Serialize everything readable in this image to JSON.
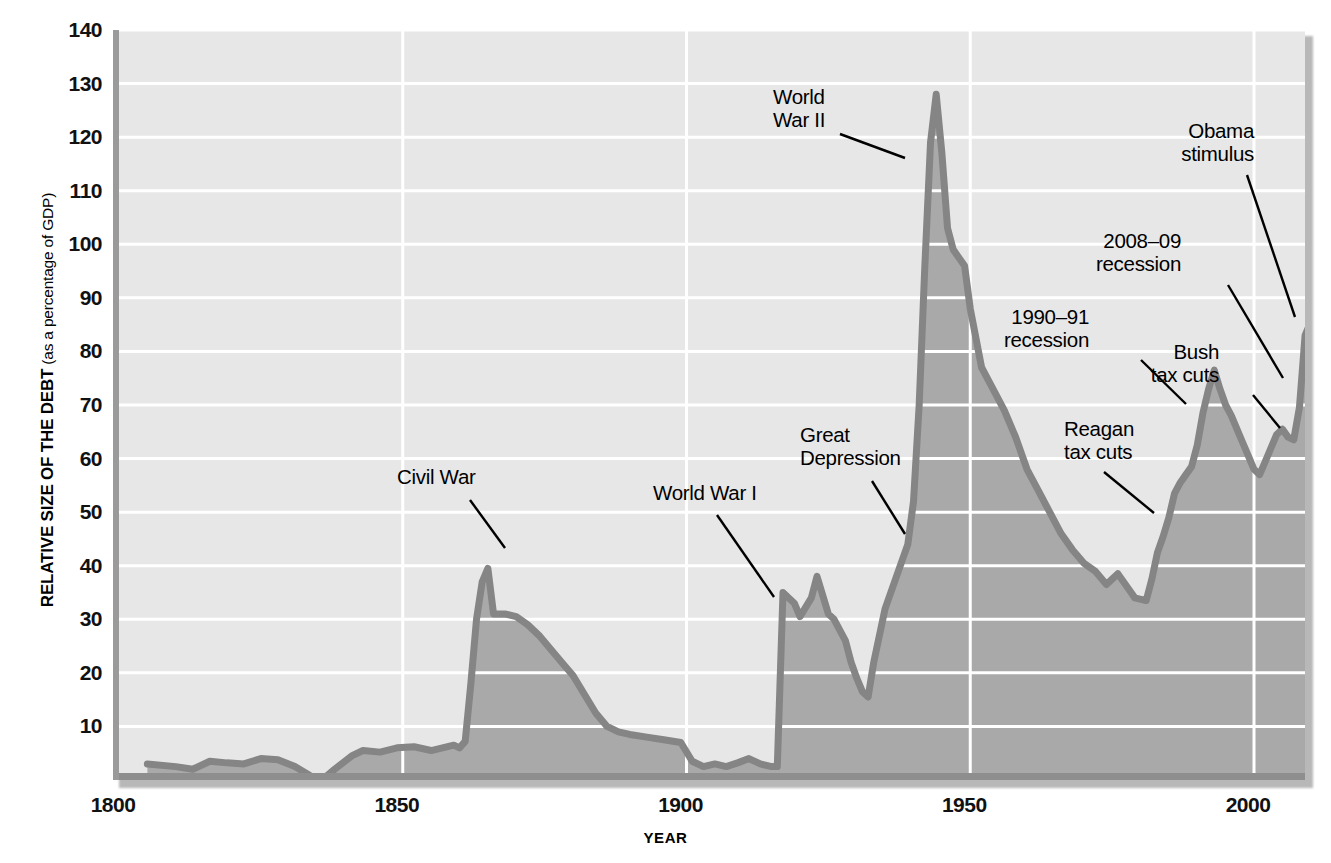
{
  "axes": {
    "y_title_main": "RELATIVE SIZE OF THE DEBT",
    "y_title_sub": " (as a percentage of GDP)",
    "x_title": "YEAR",
    "y_ticks": [
      "10",
      "20",
      "30",
      "40",
      "50",
      "60",
      "70",
      "80",
      "90",
      "100",
      "110",
      "120",
      "130",
      "140"
    ],
    "x_ticks": [
      "1800",
      "1850",
      "1900",
      "1950",
      "2000"
    ]
  },
  "colors": {
    "plot_background": "#e7e7e7",
    "area_fill": "#a9a9a9",
    "line": "#858585",
    "gridline": "#ffffff",
    "axis_spine": "#9a9a9a",
    "text": "#000000"
  },
  "annotations": [
    {
      "id": "civil-war",
      "label": "Civil War",
      "lines": [
        "Civil War"
      ],
      "align": "left",
      "x": 397,
      "y": 465,
      "leader": [
        [
          470,
          500
        ],
        [
          505,
          548
        ]
      ]
    },
    {
      "id": "world-war-1",
      "label": "World War I",
      "lines": [
        "World War I"
      ],
      "align": "left",
      "x": 653,
      "y": 481,
      "leader": [
        [
          717,
          515
        ],
        [
          774,
          597
        ]
      ]
    },
    {
      "id": "great-depression",
      "label": "Great Depression",
      "lines": [
        "Great",
        "Depression"
      ],
      "align": "left",
      "x": 800,
      "y": 423,
      "leader": [
        [
          872,
          481
        ],
        [
          905,
          534
        ]
      ]
    },
    {
      "id": "world-war-2",
      "label": "World War II",
      "lines": [
        "World",
        "War II"
      ],
      "align": "left",
      "x": 773,
      "y": 85,
      "leader": [
        [
          840,
          134
        ],
        [
          905,
          158
        ]
      ]
    },
    {
      "id": "reagan-tax-cuts",
      "label": "Reagan tax cuts",
      "lines": [
        "Reagan",
        "tax cuts"
      ],
      "align": "left",
      "x": 1064,
      "y": 417,
      "leader": [
        [
          1104,
          472
        ],
        [
          1154,
          513
        ]
      ]
    },
    {
      "id": "recession-1990",
      "label": "1990–91 recession",
      "lines": [
        "1990–91",
        "recession"
      ],
      "align": "right",
      "x": 1089,
      "y": 305,
      "leader": [
        [
          1141,
          360
        ],
        [
          1186,
          404
        ]
      ]
    },
    {
      "id": "recession-2008",
      "label": "2008–09 recession",
      "lines": [
        "2008–09",
        "recession"
      ],
      "align": "right",
      "x": 1181,
      "y": 229,
      "leader": [
        [
          1228,
          285
        ],
        [
          1283,
          378
        ]
      ]
    },
    {
      "id": "bush-tax-cuts",
      "label": "Bush tax cuts",
      "lines": [
        "Bush",
        "tax cuts"
      ],
      "align": "right",
      "x": 1219,
      "y": 340,
      "leader": [
        [
          1253,
          395
        ],
        [
          1280,
          428
        ]
      ]
    },
    {
      "id": "obama-stimulus",
      "label": "Obama stimulus",
      "lines": [
        "Obama",
        "stimulus"
      ],
      "align": "right",
      "x": 1254,
      "y": 119,
      "leader": [
        [
          1247,
          175
        ],
        [
          1295,
          317
        ]
      ]
    }
  ],
  "chart_data": {
    "type": "area",
    "title": "",
    "xlabel": "YEAR",
    "ylabel": "RELATIVE SIZE OF THE DEBT (as a percentage of GDP)",
    "xlim": [
      1800,
      2012
    ],
    "ylim": [
      0,
      140
    ],
    "grid": true,
    "legend": false,
    "x_tick_values": [
      1800,
      1850,
      1900,
      1950,
      2000
    ],
    "y_tick_values": [
      10,
      20,
      30,
      40,
      50,
      60,
      70,
      80,
      90,
      100,
      110,
      120,
      130,
      140
    ],
    "series": [
      {
        "name": "U.S. federal debt as percent of GDP",
        "points": [
          [
            1805,
            3.0
          ],
          [
            1810,
            2.5
          ],
          [
            1813,
            2.0
          ],
          [
            1816,
            3.5
          ],
          [
            1819,
            3.2
          ],
          [
            1822,
            3.0
          ],
          [
            1825,
            4.0
          ],
          [
            1828,
            3.8
          ],
          [
            1831,
            2.5
          ],
          [
            1834,
            0.6
          ],
          [
            1836,
            0.2
          ],
          [
            1838,
            2.0
          ],
          [
            1841,
            4.5
          ],
          [
            1843,
            5.5
          ],
          [
            1846,
            5.2
          ],
          [
            1849,
            6.0
          ],
          [
            1852,
            6.2
          ],
          [
            1855,
            5.5
          ],
          [
            1857,
            6.0
          ],
          [
            1859,
            6.5
          ],
          [
            1860,
            6.0
          ],
          [
            1861,
            7.2
          ],
          [
            1862,
            18.0
          ],
          [
            1863,
            30.0
          ],
          [
            1864,
            37.0
          ],
          [
            1865,
            39.5
          ],
          [
            1866,
            31.0
          ],
          [
            1868,
            31.0
          ],
          [
            1870,
            30.5
          ],
          [
            1872,
            29.0
          ],
          [
            1874,
            27.0
          ],
          [
            1876,
            24.5
          ],
          [
            1878,
            22.0
          ],
          [
            1880,
            19.5
          ],
          [
            1882,
            16.0
          ],
          [
            1884,
            12.5
          ],
          [
            1886,
            10.0
          ],
          [
            1888,
            9.0
          ],
          [
            1890,
            8.5
          ],
          [
            1893,
            8.0
          ],
          [
            1896,
            7.5
          ],
          [
            1899,
            7.0
          ],
          [
            1901,
            3.5
          ],
          [
            1903,
            2.5
          ],
          [
            1905,
            3.0
          ],
          [
            1907,
            2.5
          ],
          [
            1909,
            3.2
          ],
          [
            1911,
            4.0
          ],
          [
            1913,
            3.0
          ],
          [
            1915,
            2.5
          ],
          [
            1916,
            2.5
          ],
          [
            1917,
            35.0
          ],
          [
            1919,
            33.0
          ],
          [
            1920,
            30.5
          ],
          [
            1922,
            34.0
          ],
          [
            1923,
            38.0
          ],
          [
            1925,
            31.0
          ],
          [
            1926,
            30.0
          ],
          [
            1928,
            26.0
          ],
          [
            1929,
            22.0
          ],
          [
            1930,
            19.0
          ],
          [
            1931,
            16.5
          ],
          [
            1932,
            15.5
          ],
          [
            1933,
            22.0
          ],
          [
            1935,
            32.0
          ],
          [
            1937,
            38.0
          ],
          [
            1939,
            44.0
          ],
          [
            1940,
            52.0
          ],
          [
            1941,
            70.0
          ],
          [
            1942,
            96.0
          ],
          [
            1943,
            119.0
          ],
          [
            1944,
            128.0
          ],
          [
            1945,
            117.0
          ],
          [
            1946,
            103.0
          ],
          [
            1947,
            99.0
          ],
          [
            1948,
            97.5
          ],
          [
            1949,
            96.0
          ],
          [
            1950,
            88.0
          ],
          [
            1952,
            77.0
          ],
          [
            1954,
            73.0
          ],
          [
            1956,
            69.0
          ],
          [
            1958,
            64.0
          ],
          [
            1960,
            58.0
          ],
          [
            1962,
            54.0
          ],
          [
            1964,
            50.0
          ],
          [
            1966,
            46.0
          ],
          [
            1968,
            43.0
          ],
          [
            1970,
            40.5
          ],
          [
            1972,
            39.0
          ],
          [
            1974,
            36.5
          ],
          [
            1975,
            37.5
          ],
          [
            1976,
            38.5
          ],
          [
            1977,
            37.0
          ],
          [
            1978,
            35.5
          ],
          [
            1979,
            34.0
          ],
          [
            1981,
            33.5
          ],
          [
            1982,
            37.5
          ],
          [
            1983,
            42.5
          ],
          [
            1984,
            45.5
          ],
          [
            1985,
            49.0
          ],
          [
            1986,
            53.5
          ],
          [
            1987,
            55.5
          ],
          [
            1988,
            57.0
          ],
          [
            1989,
            58.5
          ],
          [
            1990,
            62.5
          ],
          [
            1991,
            68.5
          ],
          [
            1992,
            73.0
          ],
          [
            1993,
            76.5
          ],
          [
            1994,
            73.0
          ],
          [
            1995,
            70.0
          ],
          [
            1996,
            68.0
          ],
          [
            1997,
            65.5
          ],
          [
            1998,
            63.0
          ],
          [
            1999,
            60.5
          ],
          [
            2000,
            58.0
          ],
          [
            2001,
            57.0
          ],
          [
            2002,
            59.5
          ],
          [
            2003,
            62.0
          ],
          [
            2004,
            64.5
          ],
          [
            2005,
            65.5
          ],
          [
            2006,
            64.0
          ],
          [
            2007,
            63.5
          ],
          [
            2008,
            69.5
          ],
          [
            2009,
            83.0
          ],
          [
            2010,
            85.5
          ]
        ]
      }
    ]
  }
}
